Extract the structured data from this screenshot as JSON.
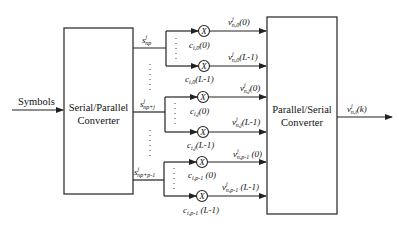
{
  "diagram": {
    "input_label": "Symbols",
    "sp_converter": {
      "line1": "Serial/Parallel",
      "line2": "Converter"
    },
    "ps_converter": {
      "line1": "Parallel/Serial",
      "line2": "Converter"
    },
    "output_label": {
      "base": "v",
      "sup": "j",
      "sub": "n,i",
      "tail": "(k)"
    },
    "groups": [
      {
        "input": {
          "base": "s",
          "sup": "j",
          "sub": "np"
        },
        "coeff_top": {
          "base": "c",
          "sub": "i,0",
          "tail": "(0)"
        },
        "coeff_bot": {
          "base": "c",
          "sub": "i,0",
          "tail": "(L-1)"
        },
        "out_top": {
          "base": "v",
          "sup": "j",
          "sub": "n,0",
          "tail": "(0)"
        },
        "out_bot": {
          "base": "v",
          "sup": "j",
          "sub": "n,0",
          "tail": "(L-1)"
        }
      },
      {
        "input": {
          "base": "s",
          "sup": "j",
          "sub": "np+j"
        },
        "coeff_top": {
          "base": "c",
          "sub": "i,j",
          "tail": "(0)"
        },
        "coeff_bot": {
          "base": "c",
          "sub": "i,j",
          "tail": "(L-1)"
        },
        "out_top": {
          "base": "v",
          "sup": "j",
          "sub": "n,j",
          "tail": "(0)"
        },
        "out_bot": {
          "base": "v",
          "sup": "j",
          "sub": "n,j",
          "tail": "(L-1)"
        }
      },
      {
        "input": {
          "base": "s",
          "sup": "j",
          "sub": "np+p-1"
        },
        "coeff_top": {
          "base": "c",
          "sub": "i,p-1",
          "tail": " (0)"
        },
        "coeff_bot": {
          "base": "c",
          "sub": "i,p-1",
          "tail": " (L-1)"
        },
        "out_top": {
          "base": "v",
          "sup": "j",
          "sub": "n,p-1",
          "tail": " (0)"
        },
        "out_bot": {
          "base": "v",
          "sup": "j",
          "sub": "n,p-1",
          "tail": " (L-1)"
        }
      }
    ],
    "multiplier_symbol": "X"
  }
}
